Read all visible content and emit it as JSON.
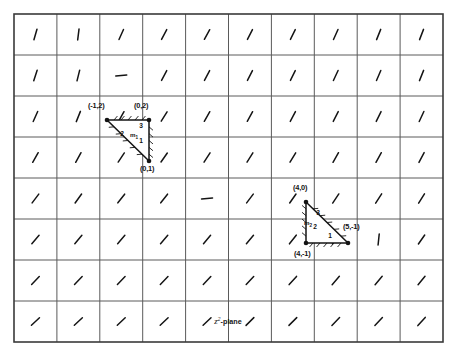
{
  "figure": {
    "caption": "z2-plane",
    "caption_base": "z",
    "caption_sup": "2",
    "caption_suffix": "-plane",
    "frame": {
      "x": 14,
      "y": 14,
      "width": 429,
      "height": 328
    },
    "grid": {
      "columns": 10,
      "rows": 8,
      "cell_width": 42.9,
      "cell_height": 41,
      "line_color": "#5a5a5a",
      "border_color": "#3a3a3a"
    },
    "colors": {
      "ink": "#141414",
      "grid": "#5a5a5a",
      "frame": "#3a3a3a",
      "background": "#ffffff"
    }
  },
  "direction_field": {
    "description": "short slash tick mark in each grid cell",
    "note": "angle measured in degrees from horizontal, counter-clockwise",
    "ticks": [
      {
        "row": 0,
        "col": 0,
        "angle": 74
      },
      {
        "row": 0,
        "col": 1,
        "angle": 83
      },
      {
        "row": 0,
        "col": 2,
        "angle": 66
      },
      {
        "row": 0,
        "col": 3,
        "angle": 62
      },
      {
        "row": 0,
        "col": 4,
        "angle": 61
      },
      {
        "row": 0,
        "col": 5,
        "angle": 63
      },
      {
        "row": 0,
        "col": 6,
        "angle": 64
      },
      {
        "row": 0,
        "col": 7,
        "angle": 66
      },
      {
        "row": 0,
        "col": 8,
        "angle": 68
      },
      {
        "row": 0,
        "col": 9,
        "angle": 69
      },
      {
        "row": 1,
        "col": 0,
        "angle": 72
      },
      {
        "row": 1,
        "col": 1,
        "angle": 76
      },
      {
        "row": 1,
        "col": 2,
        "angle": 4
      },
      {
        "row": 1,
        "col": 3,
        "angle": 62
      },
      {
        "row": 1,
        "col": 4,
        "angle": 62
      },
      {
        "row": 1,
        "col": 5,
        "angle": 63
      },
      {
        "row": 1,
        "col": 6,
        "angle": 64
      },
      {
        "row": 1,
        "col": 7,
        "angle": 65
      },
      {
        "row": 1,
        "col": 8,
        "angle": 67
      },
      {
        "row": 1,
        "col": 9,
        "angle": 68
      },
      {
        "row": 2,
        "col": 0,
        "angle": 66
      },
      {
        "row": 2,
        "col": 1,
        "angle": 68
      },
      {
        "row": 2,
        "col": 2,
        "angle": 60
      },
      {
        "row": 2,
        "col": 3,
        "angle": 58
      },
      {
        "row": 2,
        "col": 4,
        "angle": 60
      },
      {
        "row": 2,
        "col": 5,
        "angle": 61
      },
      {
        "row": 2,
        "col": 6,
        "angle": 62
      },
      {
        "row": 2,
        "col": 7,
        "angle": 63
      },
      {
        "row": 2,
        "col": 8,
        "angle": 64
      },
      {
        "row": 2,
        "col": 9,
        "angle": 65
      },
      {
        "row": 3,
        "col": 0,
        "angle": 60
      },
      {
        "row": 3,
        "col": 1,
        "angle": 61
      },
      {
        "row": 3,
        "col": 2,
        "angle": 56
      },
      {
        "row": 3,
        "col": 3,
        "angle": 55
      },
      {
        "row": 3,
        "col": 4,
        "angle": 57
      },
      {
        "row": 3,
        "col": 5,
        "angle": 58
      },
      {
        "row": 3,
        "col": 6,
        "angle": 59
      },
      {
        "row": 3,
        "col": 7,
        "angle": 60
      },
      {
        "row": 3,
        "col": 8,
        "angle": 61
      },
      {
        "row": 3,
        "col": 9,
        "angle": 62
      },
      {
        "row": 4,
        "col": 0,
        "angle": 53
      },
      {
        "row": 4,
        "col": 1,
        "angle": 54
      },
      {
        "row": 4,
        "col": 2,
        "angle": 52
      },
      {
        "row": 4,
        "col": 3,
        "angle": 52
      },
      {
        "row": 4,
        "col": 4,
        "angle": 4
      },
      {
        "row": 4,
        "col": 5,
        "angle": 53
      },
      {
        "row": 4,
        "col": 6,
        "angle": 55
      },
      {
        "row": 4,
        "col": 7,
        "angle": 56
      },
      {
        "row": 4,
        "col": 8,
        "angle": 57
      },
      {
        "row": 4,
        "col": 9,
        "angle": 58
      },
      {
        "row": 5,
        "col": 0,
        "angle": 49
      },
      {
        "row": 5,
        "col": 1,
        "angle": 50
      },
      {
        "row": 5,
        "col": 2,
        "angle": 49
      },
      {
        "row": 5,
        "col": 3,
        "angle": 49
      },
      {
        "row": 5,
        "col": 4,
        "angle": 50
      },
      {
        "row": 5,
        "col": 5,
        "angle": 50
      },
      {
        "row": 5,
        "col": 6,
        "angle": 52
      },
      {
        "row": 5,
        "col": 7,
        "angle": 53
      },
      {
        "row": 5,
        "col": 8,
        "angle": 84
      },
      {
        "row": 5,
        "col": 9,
        "angle": 55
      },
      {
        "row": 6,
        "col": 0,
        "angle": 46
      },
      {
        "row": 6,
        "col": 1,
        "angle": 46
      },
      {
        "row": 6,
        "col": 2,
        "angle": 46
      },
      {
        "row": 6,
        "col": 3,
        "angle": 46
      },
      {
        "row": 6,
        "col": 4,
        "angle": 47
      },
      {
        "row": 6,
        "col": 5,
        "angle": 47
      },
      {
        "row": 6,
        "col": 6,
        "angle": 48
      },
      {
        "row": 6,
        "col": 7,
        "angle": 49
      },
      {
        "row": 6,
        "col": 8,
        "angle": 50
      },
      {
        "row": 6,
        "col": 9,
        "angle": 51
      },
      {
        "row": 7,
        "col": 0,
        "angle": 43
      },
      {
        "row": 7,
        "col": 1,
        "angle": 43
      },
      {
        "row": 7,
        "col": 2,
        "angle": 44
      },
      {
        "row": 7,
        "col": 3,
        "angle": 44
      },
      {
        "row": 7,
        "col": 4,
        "angle": 44
      },
      {
        "row": 7,
        "col": 5,
        "angle": 45
      },
      {
        "row": 7,
        "col": 6,
        "angle": 45
      },
      {
        "row": 7,
        "col": 7,
        "angle": 46
      },
      {
        "row": 7,
        "col": 8,
        "angle": 47
      },
      {
        "row": 7,
        "col": 9,
        "angle": 48
      }
    ]
  },
  "triangles": [
    {
      "name": "triangle-m1",
      "region_label": "m",
      "region_subscript": "1",
      "vertices": [
        {
          "label": "(-1,2)",
          "x": 107,
          "y": 120,
          "label_x": 88,
          "label_y": 108
        },
        {
          "label": "(0,2)",
          "x": 149,
          "y": 120,
          "label_x": 134,
          "label_y": 108
        },
        {
          "label": "(0,1)",
          "x": 149,
          "y": 161,
          "label_x": 140,
          "label_y": 171
        }
      ],
      "side_labels": [
        {
          "text": "2",
          "x": 122,
          "y": 136
        },
        {
          "text": "3",
          "x": 141,
          "y": 128
        },
        {
          "text": "1",
          "x": 141,
          "y": 143
        }
      ],
      "region_label_x": 134,
      "region_label_y": 137
    },
    {
      "name": "triangle-m2",
      "region_label": "m",
      "region_subscript": "2",
      "vertices": [
        {
          "label": "(4,0)",
          "x": 306,
          "y": 202,
          "label_x": 293,
          "label_y": 190
        },
        {
          "label": "(5,-1)",
          "x": 348,
          "y": 243,
          "label_x": 343,
          "label_y": 229
        },
        {
          "label": "(4,-1)",
          "x": 306,
          "y": 243,
          "label_x": 294,
          "label_y": 256
        }
      ],
      "side_labels": [
        {
          "text": "3",
          "x": 318,
          "y": 215
        },
        {
          "text": "2",
          "x": 315,
          "y": 229
        },
        {
          "text": "1",
          "x": 330,
          "y": 238
        }
      ],
      "region_label_x": 308,
      "region_label_y": 225
    }
  ]
}
